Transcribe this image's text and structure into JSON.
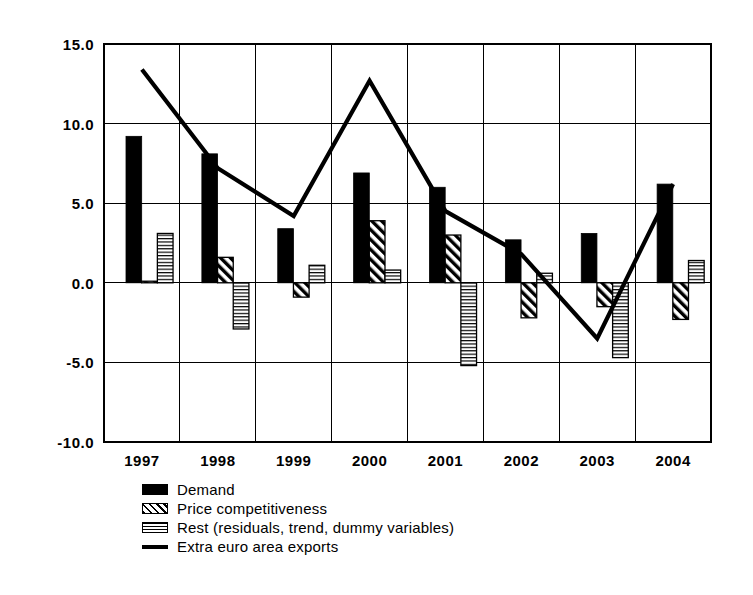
{
  "chart_data": {
    "type": "bar",
    "title": "",
    "subtitle": "",
    "xlabel": "",
    "ylabel": "",
    "categories": [
      "1997",
      "1998",
      "1999",
      "2000",
      "2001",
      "2002",
      "2003",
      "2004"
    ],
    "ylim": [
      -10.0,
      15.0
    ],
    "ytick_labels": [
      "15.0",
      "10.0",
      "5.0",
      "0.0",
      "-5.0",
      "-10.0"
    ],
    "ytick_values": [
      15.0,
      10.0,
      5.0,
      0.0,
      -5.0,
      -10.0
    ],
    "grid": true,
    "legend_position": "bottom-left",
    "series": [
      {
        "name": "Demand",
        "style": "bar",
        "fill": "solid-black",
        "color": "#000000",
        "values": [
          9.2,
          8.1,
          3.4,
          6.9,
          6.0,
          2.7,
          3.1,
          6.2
        ]
      },
      {
        "name": "Price competitiveness",
        "style": "bar",
        "fill": "diagonal-hatch",
        "color": "#000000",
        "values": [
          0.1,
          1.6,
          -0.9,
          3.9,
          3.0,
          -2.2,
          -1.5,
          -2.3
        ]
      },
      {
        "name": "Rest (residuals, trend, dummy variables)",
        "style": "bar",
        "fill": "horizontal-lines",
        "color": "#000000",
        "values": [
          3.1,
          -2.9,
          1.1,
          0.8,
          -5.2,
          0.6,
          -4.7,
          1.4
        ]
      },
      {
        "name": "Extra euro area exports",
        "style": "line",
        "fill": "none",
        "color": "#000000",
        "values": [
          13.4,
          7.2,
          4.2,
          12.7,
          4.5,
          1.8,
          -3.5,
          6.2
        ]
      }
    ]
  },
  "legend": {
    "items": [
      {
        "label": "Demand",
        "swatch": "solid"
      },
      {
        "label": "Price competitiveness",
        "swatch": "hatch"
      },
      {
        "label": "Rest (residuals, trend, dummy variables)",
        "swatch": "hlines"
      },
      {
        "label": "Extra euro area exports",
        "swatch": "line"
      }
    ]
  },
  "plot": {
    "left": 104,
    "right": 711,
    "top": 44,
    "bottom": 442
  }
}
